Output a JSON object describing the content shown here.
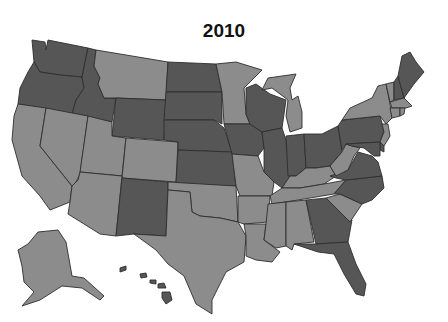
{
  "title": "2010",
  "colors": {
    "dark": "#565656",
    "light": "#8c8c8c",
    "border": "#2e2e2e",
    "background": "#ffffff"
  },
  "legend": "none visible",
  "states": {
    "WA": "dark",
    "OR": "dark",
    "ID": "dark",
    "MT": "light",
    "WY": "dark",
    "CA": "light",
    "NV": "light",
    "UT": "light",
    "CO": "light",
    "AZ": "light",
    "NM": "dark",
    "ND": "dark",
    "SD": "dark",
    "NE": "dark",
    "KS": "dark",
    "OK": "light",
    "TX": "light",
    "MN": "light",
    "IA": "dark",
    "MO": "light",
    "AR": "light",
    "LA": "light",
    "WI": "dark",
    "IL": "dark",
    "MI": "light",
    "IN": "dark",
    "OH": "dark",
    "KY": "light",
    "TN": "light",
    "MS": "light",
    "AL": "light",
    "GA": "dark",
    "FL": "dark",
    "SC": "light",
    "NC": "dark",
    "VA": "dark",
    "WV": "light",
    "PA": "dark",
    "NY": "light",
    "VT": "light",
    "NH": "dark",
    "ME": "dark",
    "MA": "light",
    "RI": "light",
    "CT": "light",
    "NJ": "light",
    "DE": "dark",
    "MD": "dark",
    "AK": "light",
    "HI": "dark"
  }
}
